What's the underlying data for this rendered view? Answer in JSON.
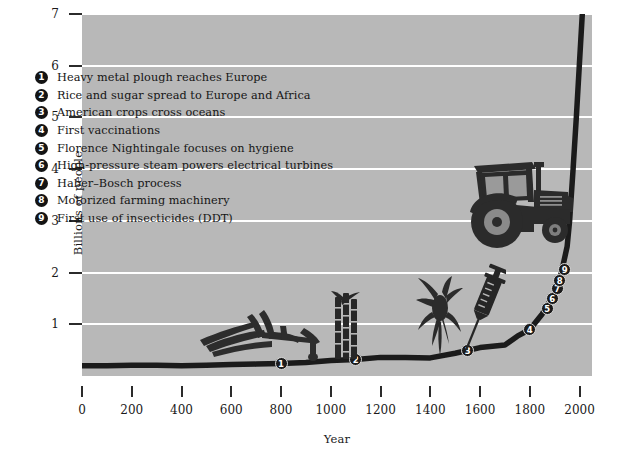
{
  "chart_data": {
    "type": "line",
    "title": "",
    "subtitle": "",
    "xlabel": "Year",
    "ylabel": "Billions of people",
    "xlim": [
      0,
      2050
    ],
    "ylim": [
      0,
      7
    ],
    "grid": true,
    "legend_position": "inside-upper-left",
    "x_ticks": [
      0,
      200,
      400,
      600,
      800,
      1000,
      1200,
      1400,
      1600,
      1800,
      2000
    ],
    "x_tick_labels": [
      "0",
      "200",
      "400",
      "600",
      "800",
      "1000",
      "1200",
      "1400",
      "1600",
      "1800",
      "2000"
    ],
    "y_ticks": [
      1,
      2,
      3,
      4,
      5,
      6,
      7
    ],
    "y_tick_labels": [
      "1",
      "2",
      "3",
      "4",
      "5",
      "6",
      "7"
    ],
    "series": [
      {
        "name": "World population",
        "x": [
          0,
          100,
          200,
          300,
          400,
          500,
          600,
          700,
          800,
          900,
          1000,
          1100,
          1200,
          1300,
          1400,
          1500,
          1600,
          1700,
          1750,
          1800,
          1850,
          1900,
          1927,
          1950,
          1960,
          1974,
          1987,
          1999,
          2005,
          2011
        ],
        "values": [
          0.2,
          0.2,
          0.21,
          0.21,
          0.2,
          0.21,
          0.22,
          0.23,
          0.24,
          0.26,
          0.3,
          0.32,
          0.36,
          0.36,
          0.35,
          0.44,
          0.55,
          0.6,
          0.77,
          0.9,
          1.2,
          1.6,
          2.0,
          2.5,
          3.0,
          4.0,
          5.0,
          6.0,
          6.5,
          7.0
        ]
      }
    ],
    "annotations": [
      {
        "id": 1,
        "label": "Heavy metal plough reaches Europe",
        "x": 800,
        "y": 0.24
      },
      {
        "id": 2,
        "label": "Rice and sugar spread to Europe and Africa",
        "x": 1100,
        "y": 0.32
      },
      {
        "id": 3,
        "label": "American crops cross oceans",
        "x": 1550,
        "y": 0.5
      },
      {
        "id": 4,
        "label": "First vaccinations",
        "x": 1800,
        "y": 0.9
      },
      {
        "id": 5,
        "label": "Florence Nightingale focuses on hygiene",
        "x": 1870,
        "y": 1.3
      },
      {
        "id": 6,
        "label": "High-pressure steam powers electrical turbines",
        "x": 1890,
        "y": 1.5
      },
      {
        "id": 7,
        "label": "Haber–Bosch process",
        "x": 1910,
        "y": 1.7
      },
      {
        "id": 8,
        "label": "Motorized farming machinery",
        "x": 1920,
        "y": 1.85
      },
      {
        "id": 9,
        "label": "First use of insecticides (DDT)",
        "x": 1940,
        "y": 2.05
      }
    ]
  },
  "axes": {
    "y_title": "Billions of people",
    "x_title": "Year"
  },
  "legend": {
    "items": [
      {
        "num": "1",
        "label": "Heavy metal plough reaches Europe"
      },
      {
        "num": "2",
        "label": "Rice and sugar spread to Europe and Africa"
      },
      {
        "num": "3",
        "label": "American crops cross oceans"
      },
      {
        "num": "4",
        "label": "First vaccinations"
      },
      {
        "num": "5",
        "label": "Florence Nightingale focuses on hygiene"
      },
      {
        "num": "6",
        "label": "High-pressure steam powers electrical turbines"
      },
      {
        "num": "7",
        "label": "Haber–Bosch process"
      },
      {
        "num": "8",
        "label": "Motorized farming machinery"
      },
      {
        "num": "9",
        "label": "First use of insecticides (DDT)"
      }
    ]
  },
  "markers": [
    {
      "num": "1"
    },
    {
      "num": "2"
    },
    {
      "num": "3"
    },
    {
      "num": "4"
    },
    {
      "num": "5"
    },
    {
      "num": "6"
    },
    {
      "num": "7"
    },
    {
      "num": "8"
    },
    {
      "num": "9"
    }
  ],
  "illustrations": [
    {
      "name": "plough-illustration"
    },
    {
      "name": "sugar-cane-illustration"
    },
    {
      "name": "maize-illustration"
    },
    {
      "name": "syringe-illustration"
    },
    {
      "name": "tractor-illustration"
    }
  ],
  "colors": {
    "plot_background": "#b8b8b8",
    "gridline": "#ffffff",
    "curve": "#1b1b1b",
    "text": "#151515",
    "page_background": "#ffffff"
  }
}
